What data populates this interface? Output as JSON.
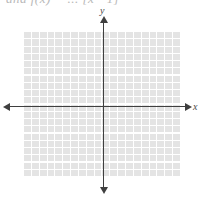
{
  "figure": {
    "clipped_expression": "and f(x) = ... [x - 1]",
    "axes": {
      "x_label": "x",
      "y_label": "y",
      "axis_color": "#3f3f3f"
    },
    "grid": {
      "panel_color": "#e4e4e4",
      "line_color": "#ffffff",
      "columns": 20,
      "rows": 20
    }
  },
  "chart_data": {
    "type": "line",
    "title": "",
    "xlabel": "x",
    "ylabel": "y",
    "series": [],
    "x": [],
    "values": [],
    "xlim": [
      -10,
      10
    ],
    "ylim": [
      -10,
      10
    ],
    "grid": true,
    "legend": "none",
    "annotations": []
  }
}
